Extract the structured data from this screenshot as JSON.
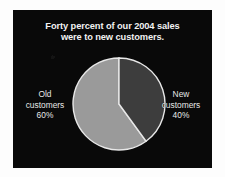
{
  "slide": {
    "title_line1": "Forty percent of our 2004 sales",
    "title_line2": "were to new customers.",
    "background_color": "#090909",
    "title_color": "#f2f2f2"
  },
  "labels": {
    "old": {
      "name_line1": "Old",
      "name_line2": "customers",
      "value": "60%"
    },
    "new": {
      "name_line1": "New",
      "name_line2": "customers",
      "value": "40%"
    }
  },
  "chart_data": {
    "type": "pie",
    "title": "Forty percent of our 2004 sales were to new customers.",
    "categories": [
      "Old customers",
      "New customers"
    ],
    "values": [
      60,
      40
    ],
    "value_labels": [
      "60%",
      "40%"
    ],
    "colors": [
      "#9a9a9a",
      "#3d3d3d"
    ],
    "slice_border_color": "#e8e8e8",
    "start_angle_deg": 0,
    "direction": "clockwise",
    "legend": "side-labels",
    "grid": false,
    "xlabel": "",
    "ylabel": ""
  }
}
